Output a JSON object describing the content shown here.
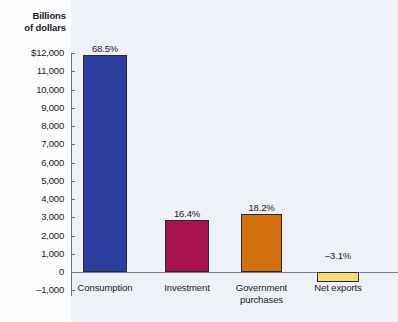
{
  "chart_data": {
    "type": "bar",
    "title": "",
    "axis_title": [
      "Billions",
      "of dollars"
    ],
    "xlabel": "",
    "ylabel": "Billions of dollars",
    "ylim": [
      -1000,
      12000
    ],
    "grid": false,
    "legend": "none",
    "categories": [
      "Consumption",
      "Investment",
      "Government purchases",
      "Net exports"
    ],
    "category_lines": [
      [
        "Consumption"
      ],
      [
        "Investment"
      ],
      [
        "Government",
        "purchases"
      ],
      [
        "Net exports"
      ]
    ],
    "values": [
      11900,
      2850,
      3160,
      -540
    ],
    "data_labels": [
      "68.5%",
      "16.4%",
      "18.2%",
      "–3.1%"
    ],
    "bar_colors": [
      "#2c3e9e",
      "#a8134d",
      "#d2700f",
      "#f5dc78"
    ],
    "bar_border_color": "#2b2b2b",
    "ytick_labels": [
      "$12,000",
      "11,000",
      "10,000",
      "9,000",
      "8,000",
      "7,000",
      "6,000",
      "5,000",
      "4,000",
      "3,000",
      "2,000",
      "1,000",
      "0",
      "–1,000"
    ],
    "ytick_values": [
      12000,
      11000,
      10000,
      9000,
      8000,
      7000,
      6000,
      5000,
      4000,
      3000,
      2000,
      1000,
      0,
      -1000
    ]
  },
  "colors": {
    "panel_background": "#eef1f7",
    "margin_background": "#fbfcfd",
    "axis": "#6d6f73",
    "text": "#1a1a1a"
  }
}
